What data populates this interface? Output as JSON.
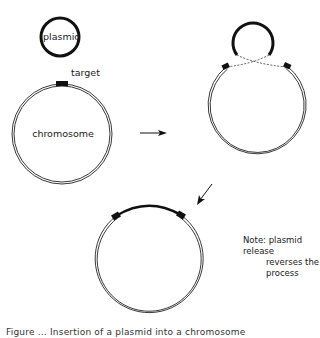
{
  "diagram": {
    "type": "process-diagram",
    "stage1": {
      "plasmid_label": "plasmid",
      "target_label": "target",
      "chromosome_label": "chromosome"
    },
    "arrows": [
      {
        "name": "step-1-to-2",
        "direction": "right"
      },
      {
        "name": "step-2-to-3",
        "direction": "down-left"
      }
    ],
    "stage2": {
      "description": "plasmid aligns with target; crossover shown with dashed lines"
    },
    "stage3": {
      "description": "plasmid inserted into chromosome (thick arc between target sites)"
    },
    "note": {
      "line1": "Note: plasmid release",
      "line2": "reverses the",
      "line3": "process"
    },
    "caption": "Figure ... Insertion of a plasmid into a chromosome"
  },
  "colors": {
    "ink": "#111111",
    "background": "#ffffff"
  }
}
